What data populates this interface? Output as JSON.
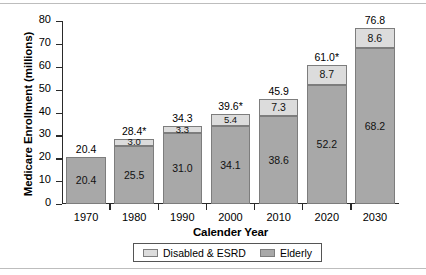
{
  "chart_data": {
    "type": "bar",
    "subtype": "stacked-bar",
    "title": "",
    "xlabel": "Calender Year",
    "ylabel": "Medicare Enrollment (millions)",
    "categories": [
      "1970",
      "1980",
      "1990",
      "2000",
      "2010",
      "2020",
      "2030"
    ],
    "ylim": [
      0,
      80
    ],
    "yticks": [
      "0",
      "10",
      "20",
      "30",
      "40",
      "50",
      "60",
      "70",
      "80"
    ],
    "grid": false,
    "legend_position": "bottom-center",
    "series": [
      {
        "name": "Elderly",
        "color": "#a8a8a8",
        "values": [
          20.4,
          25.5,
          31.0,
          34.1,
          38.6,
          52.2,
          68.2
        ],
        "labels": [
          "20.4",
          "25.5",
          "31.0",
          "34.1",
          "38.6",
          "52.2",
          "68.2"
        ]
      },
      {
        "name": "Disabled & ESRD",
        "color": "#dcdcdc",
        "values": [
          0,
          3.0,
          3.3,
          5.4,
          7.3,
          8.7,
          8.6
        ],
        "labels": [
          "",
          "3.0",
          "3.3",
          "5.4",
          "7.3",
          "8.7",
          "8.6"
        ]
      }
    ],
    "totals": [
      20.4,
      28.4,
      34.3,
      39.6,
      45.9,
      61.0,
      76.8
    ],
    "total_labels": [
      "20.4",
      "28.4*",
      "34.3",
      "39.6*",
      "45.9",
      "61.0*",
      "76.8"
    ]
  },
  "legend": {
    "items": [
      {
        "label": "Disabled & ESRD",
        "swatch": "disabled"
      },
      {
        "label": "Elderly",
        "swatch": "elderly"
      }
    ]
  }
}
